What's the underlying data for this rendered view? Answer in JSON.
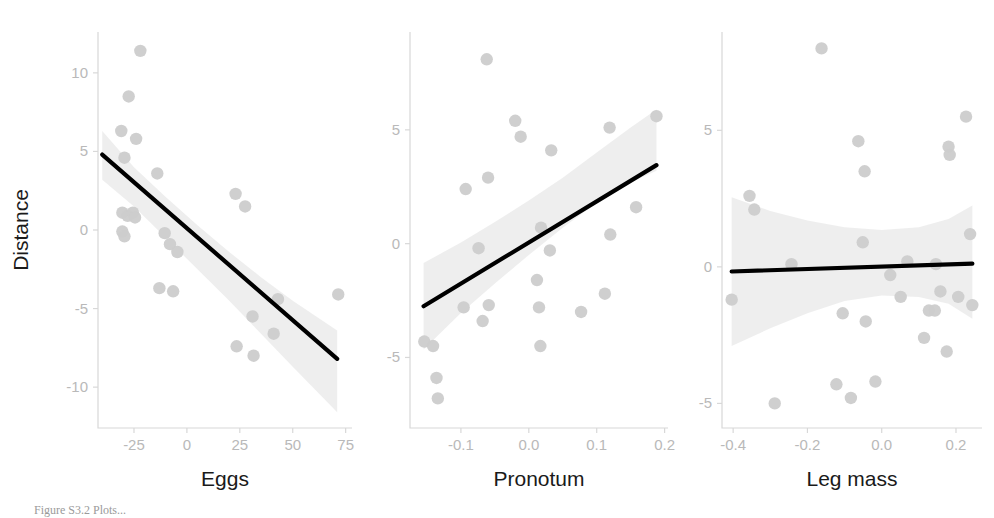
{
  "figure": {
    "shared_ylabel": "Distance",
    "point_color": "#cccccc",
    "line_color": "#000000",
    "ribbon_color": "#ebebeb",
    "tick_color": "#b9b9b9",
    "axis_color": "#d8d8d8",
    "caption_partial": "Figure S3.2 Plots..."
  },
  "chart_data": [
    {
      "type": "scatter",
      "title": "",
      "xlabel": "Eggs",
      "ylabel": "Distance",
      "xlim": [
        -42,
        78
      ],
      "ylim": [
        -12.6,
        12.6
      ],
      "xticks": [
        -25,
        0,
        25,
        50,
        75
      ],
      "yticks": [
        -10,
        -5,
        0,
        5,
        10
      ],
      "xtick_labels": [
        "-25",
        "0",
        "25",
        "50",
        "75"
      ],
      "ytick_labels": [
        "-10",
        "-5",
        "0",
        "5",
        "10"
      ],
      "grid": false,
      "legend": "none",
      "points": [
        [
          -22.0,
          11.4
        ],
        [
          -27.5,
          8.5
        ],
        [
          -31.0,
          6.3
        ],
        [
          -24.0,
          5.8
        ],
        [
          -29.5,
          4.6
        ],
        [
          -14.0,
          3.6
        ],
        [
          -30.5,
          1.1
        ],
        [
          -28.0,
          0.9
        ],
        [
          -25.5,
          1.1
        ],
        [
          -24.5,
          0.8
        ],
        [
          -30.5,
          -0.1
        ],
        [
          -29.5,
          -0.4
        ],
        [
          -10.5,
          -0.2
        ],
        [
          -8.0,
          -0.9
        ],
        [
          -4.5,
          -1.4
        ],
        [
          23.0,
          2.3
        ],
        [
          27.5,
          1.5
        ],
        [
          -13.0,
          -3.7
        ],
        [
          -6.5,
          -3.9
        ],
        [
          43.0,
          -4.4
        ],
        [
          71.5,
          -4.1
        ],
        [
          31.0,
          -5.5
        ],
        [
          41.0,
          -6.6
        ],
        [
          23.5,
          -7.4
        ],
        [
          31.5,
          -8.0
        ]
      ],
      "fit_line": {
        "x": [
          -40.0,
          71.0
        ],
        "y": [
          4.8,
          -8.2
        ]
      },
      "ci_band": {
        "x": [
          -40.0,
          -25.0,
          -10.0,
          5.0,
          20.0,
          35.0,
          50.0,
          71.0
        ],
        "upper": [
          6.3,
          4.0,
          2.1,
          0.3,
          -1.4,
          -3.0,
          -4.5,
          -6.4
        ],
        "lower": [
          3.2,
          1.5,
          -0.5,
          -2.5,
          -4.5,
          -6.6,
          -8.7,
          -11.6
        ]
      }
    },
    {
      "type": "scatter",
      "title": "",
      "xlabel": "Pronotum",
      "ylabel": "Distance",
      "xlim": [
        -0.175,
        0.205
      ],
      "ylim": [
        -8.1,
        9.3
      ],
      "xticks": [
        -0.1,
        0.0,
        0.1,
        0.2
      ],
      "yticks": [
        -5,
        0,
        5
      ],
      "xtick_labels": [
        "-0.1",
        "0.0",
        "0.1",
        "0.2"
      ],
      "ytick_labels": [
        "-5",
        "0",
        "5"
      ],
      "grid": false,
      "legend": "none",
      "points": [
        [
          -0.062,
          8.1
        ],
        [
          -0.02,
          5.4
        ],
        [
          0.188,
          5.6
        ],
        [
          0.119,
          5.1
        ],
        [
          -0.012,
          4.7
        ],
        [
          0.033,
          4.1
        ],
        [
          -0.06,
          2.9
        ],
        [
          -0.093,
          2.4
        ],
        [
          0.158,
          1.6
        ],
        [
          0.018,
          0.7
        ],
        [
          0.12,
          0.4
        ],
        [
          -0.074,
          -0.2
        ],
        [
          0.031,
          -0.3
        ],
        [
          0.012,
          -1.6
        ],
        [
          0.112,
          -2.2
        ],
        [
          -0.096,
          -2.8
        ],
        [
          -0.059,
          -2.7
        ],
        [
          0.015,
          -2.8
        ],
        [
          0.077,
          -3.0
        ],
        [
          -0.068,
          -3.4
        ],
        [
          -0.154,
          -4.3
        ],
        [
          -0.141,
          -4.5
        ],
        [
          0.017,
          -4.5
        ],
        [
          -0.136,
          -5.9
        ],
        [
          -0.134,
          -6.8
        ]
      ],
      "fit_line": {
        "x": [
          -0.155,
          0.188
        ],
        "y": [
          -2.75,
          3.45
        ]
      },
      "ci_band": {
        "x": [
          -0.155,
          -0.1,
          -0.05,
          0.0,
          0.05,
          0.1,
          0.15,
          0.188
        ],
        "upper": [
          -0.85,
          0.05,
          0.95,
          1.9,
          2.9,
          4.0,
          5.1,
          5.9
        ],
        "lower": [
          -4.65,
          -3.05,
          -1.75,
          -0.5,
          0.7,
          1.8,
          2.7,
          3.2
        ]
      }
    },
    {
      "type": "scatter",
      "title": "",
      "xlabel": "Leg mass",
      "ylabel": "Distance",
      "xlim": [
        -0.43,
        0.27
      ],
      "ylim": [
        -5.9,
        8.6
      ],
      "xticks": [
        -0.4,
        -0.2,
        0.0,
        0.2
      ],
      "yticks": [
        -5,
        0,
        5
      ],
      "xtick_labels": [
        "-0.4",
        "-0.2",
        "0.0",
        "0.2"
      ],
      "ytick_labels": [
        "-5",
        "0",
        "5"
      ],
      "grid": false,
      "legend": "none",
      "points": [
        [
          -0.162,
          8.0
        ],
        [
          0.227,
          5.5
        ],
        [
          -0.063,
          4.6
        ],
        [
          0.18,
          4.4
        ],
        [
          0.183,
          4.1
        ],
        [
          -0.046,
          3.5
        ],
        [
          -0.356,
          2.6
        ],
        [
          -0.343,
          2.1
        ],
        [
          -0.051,
          0.9
        ],
        [
          0.238,
          1.2
        ],
        [
          -0.243,
          0.1
        ],
        [
          0.069,
          0.2
        ],
        [
          0.146,
          0.1
        ],
        [
          0.023,
          -0.3
        ],
        [
          0.051,
          -1.1
        ],
        [
          0.158,
          -0.9
        ],
        [
          -0.404,
          -1.2
        ],
        [
          0.206,
          -1.1
        ],
        [
          0.244,
          -1.4
        ],
        [
          0.127,
          -1.6
        ],
        [
          0.143,
          -1.6
        ],
        [
          -0.105,
          -1.7
        ],
        [
          -0.043,
          -2.0
        ],
        [
          0.114,
          -2.6
        ],
        [
          0.175,
          -3.1
        ],
        [
          -0.122,
          -4.3
        ],
        [
          -0.017,
          -4.2
        ],
        [
          -0.083,
          -4.8
        ],
        [
          -0.288,
          -5.0
        ]
      ],
      "fit_line": {
        "x": [
          -0.404,
          0.244
        ],
        "y": [
          -0.17,
          0.12
        ]
      },
      "ci_band": {
        "x": [
          -0.404,
          -0.3,
          -0.2,
          -0.1,
          0.0,
          0.1,
          0.18,
          0.244
        ],
        "upper": [
          2.55,
          2.05,
          1.7,
          1.45,
          1.35,
          1.45,
          1.75,
          2.25
        ],
        "lower": [
          -2.9,
          -2.25,
          -1.7,
          -1.25,
          -1.05,
          -1.1,
          -1.35,
          -1.9
        ]
      }
    }
  ]
}
